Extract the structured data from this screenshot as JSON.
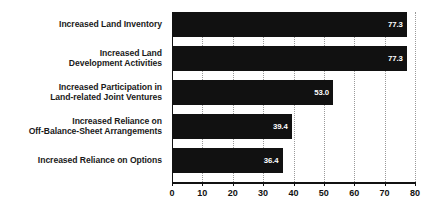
{
  "chart_data": {
    "type": "bar",
    "orientation": "horizontal",
    "title": "",
    "subtitle": "",
    "xlabel": "",
    "ylabel": "",
    "xlim": [
      0,
      80
    ],
    "xticks": [
      0,
      10,
      20,
      30,
      40,
      50,
      60,
      70,
      80
    ],
    "xtick_labels": [
      "0",
      "10",
      "20",
      "30",
      "40",
      "50",
      "60",
      "70",
      "80"
    ],
    "grid": true,
    "grid_axis": "x",
    "grid_style": "dotted",
    "legend": false,
    "legend_position": "none",
    "bar_color": "#111111",
    "value_label_color": "#ffffff",
    "categories": [
      "Increased Land Inventory",
      "Increased Land Development Activities",
      "Increased Participation in Land-related Joint Ventures",
      "Increased Reliance on Off-Balance-Sheet Arrangements",
      "Increased Reliance on Options"
    ],
    "category_lines": [
      [
        "Increased Land Inventory"
      ],
      [
        "Increased Land",
        "Development Activities"
      ],
      [
        "Increased Participation in",
        "Land-related Joint Ventures"
      ],
      [
        "Increased Reliance on",
        "Off-Balance-Sheet Arrangements"
      ],
      [
        "Increased Reliance on Options"
      ]
    ],
    "values": [
      77.3,
      77.3,
      53.0,
      39.4,
      36.4
    ],
    "value_labels": [
      "77.3",
      "77.3",
      "53.0",
      "39.4",
      "36.4"
    ]
  }
}
